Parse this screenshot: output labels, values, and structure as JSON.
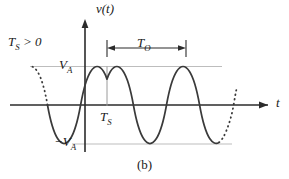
{
  "figure": {
    "caption": "(b)",
    "axes": {
      "y_label": "v(t)",
      "x_label": "t"
    },
    "annotations": {
      "shift_condition": "T_S > 0",
      "amplitude_pos": "V_A",
      "amplitude_neg": "−V_A",
      "time_shift": "T_S",
      "period": "T_O"
    },
    "colors": {
      "curve": "#3a3a3a",
      "axis": "#2b2b2b",
      "gridline": "#bdbdbd",
      "background": "#ffffff"
    }
  },
  "chart_data": {
    "type": "line",
    "title": "(b)",
    "xlabel": "t",
    "ylabel": "v(t)",
    "waveform": {
      "form": "cosine",
      "amplitude": "V_A",
      "amplitude_px": 39,
      "period": "T_O",
      "period_px": 79,
      "phase_shift": "T_S",
      "phase_shift_px": 22
    },
    "grid": true,
    "gridlines": [
      "V_A",
      "−V_A"
    ],
    "legend": "none",
    "ylim": [
      "−V_A",
      "V_A"
    ],
    "markers": [
      {
        "name": "first-peak",
        "x_px": 107,
        "y": "V_A"
      },
      {
        "name": "first-trough",
        "x_px": 147,
        "y": "−V_A"
      },
      {
        "name": "second-peak",
        "x_px": 186,
        "y": "V_A"
      }
    ],
    "period_bracket": {
      "from_px": 107,
      "to_px": 186,
      "label": "T_O"
    },
    "dashed_segments": [
      "left-continuation",
      "right-continuation"
    ]
  }
}
